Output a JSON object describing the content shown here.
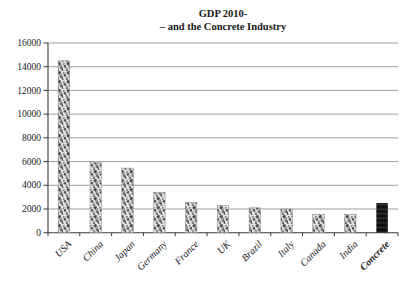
{
  "chart": {
    "title_line1": "GDP 2010-",
    "title_line2": "– and the Concrete Industry"
  },
  "chart_data": {
    "type": "bar",
    "title": "GDP 2010- – and the Concrete Industry",
    "categories": [
      "USA",
      "China",
      "Japan",
      "Germany",
      "France",
      "UK",
      "Brazil",
      "Italy",
      "Canada",
      "India",
      "Concrete"
    ],
    "values": [
      14500,
      5900,
      5450,
      3400,
      2550,
      2300,
      2100,
      2000,
      1550,
      1550,
      2500
    ],
    "highlight_category": "Concrete",
    "xlabel": "",
    "ylabel": "",
    "ylim": [
      0,
      16000
    ],
    "ytick_interval": 2000,
    "ytick_labels": [
      "0",
      "2000",
      "4000",
      "6000",
      "8000",
      "10000",
      "12000",
      "14000",
      "16000"
    ],
    "grid": "horizontal",
    "legend": "none",
    "bar_style": "speckled-texture",
    "highlight_bar_style": "solid-black",
    "colors": {
      "background": "#ffffff",
      "grid_line": "#8a8a8a",
      "axis_line": "#3a3a3a",
      "text": "#1a1a1a",
      "bar_texture_bg": "#e5e5e5",
      "bar_texture_dot": "#4a4a4a",
      "bar_border": "#8c8c8c",
      "highlight_bar": "#111111"
    }
  }
}
